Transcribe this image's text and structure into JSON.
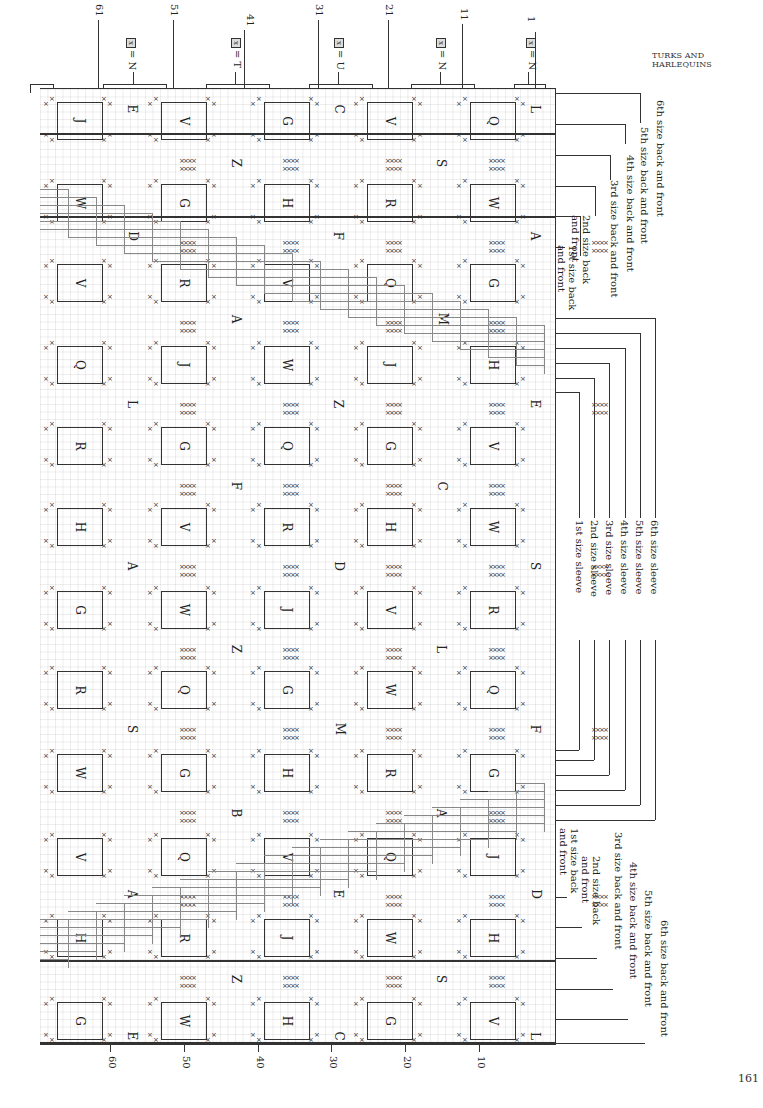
{
  "page": {
    "running_head": "TURKS AND HARLEQUINS",
    "page_number": "161"
  },
  "top_axis": {
    "stitch_numbers": [
      "61",
      "51",
      "41",
      "31",
      "21",
      "11",
      "1"
    ],
    "legend": [
      {
        "symbol": "x",
        "text": "= N"
      },
      {
        "symbol": "x",
        "text": "= T"
      },
      {
        "symbol": "x",
        "text": "= U"
      },
      {
        "symbol": "x",
        "text": "= N"
      },
      {
        "symbol": "x",
        "text": "= N"
      }
    ]
  },
  "bottom_axis": {
    "row_numbers": [
      "60",
      "50",
      "40",
      "30",
      "20",
      "10"
    ]
  },
  "chart": {
    "boxes": [
      [
        "J",
        "V",
        "G",
        "V",
        "Q"
      ],
      [
        "W",
        "G",
        "H",
        "R",
        "W"
      ],
      [
        "V",
        "R",
        "V",
        "Q",
        "G"
      ],
      [
        "Q",
        "J",
        "W",
        "J",
        "H"
      ],
      [
        "R",
        "G",
        "Q",
        "G",
        "V"
      ],
      [
        "H",
        "V",
        "R",
        "H",
        "W"
      ],
      [
        "G",
        "W",
        "J",
        "V",
        "R"
      ],
      [
        "R",
        "Q",
        "G",
        "W",
        "Q"
      ],
      [
        "W",
        "G",
        "H",
        "R",
        "G"
      ],
      [
        "V",
        "Q",
        "V",
        "Q",
        "J"
      ],
      [
        "H",
        "R",
        "J",
        "W",
        "H"
      ],
      [
        "G",
        "W",
        "H",
        "G",
        "V"
      ]
    ],
    "centre_letters": [
      [
        "E",
        "C",
        "L"
      ],
      [
        "Z",
        "S"
      ],
      [
        "D",
        "F",
        "A"
      ],
      [
        "A",
        "M"
      ],
      [
        "L",
        "Z",
        "E"
      ],
      [
        "F",
        "C"
      ],
      [
        "A",
        "D",
        "S"
      ],
      [
        "Z",
        "L"
      ],
      [
        "S",
        "M",
        "F"
      ],
      [
        "B",
        "A"
      ],
      [
        "A",
        "E",
        "D"
      ],
      [
        "Z",
        "S"
      ],
      [
        "E",
        "C",
        "L"
      ]
    ]
  },
  "size_labels": {
    "upper_back_front": [
      "1st size back and front",
      "2nd size back and front",
      "3rd size back and front",
      "4th size back and front",
      "5th size back and front",
      "6th size back and front"
    ],
    "sleeve": [
      "1st size sleeve",
      "2nd size sleeve",
      "3rd size sleeve",
      "4th size sleeve",
      "5th size sleeve",
      "6th size sleeve"
    ],
    "lower_back_front": [
      "1st size back and front",
      "2nd size back and front",
      "3rd size back and front",
      "4th size back and front",
      "5th size back and front",
      "6th size back and front"
    ]
  }
}
